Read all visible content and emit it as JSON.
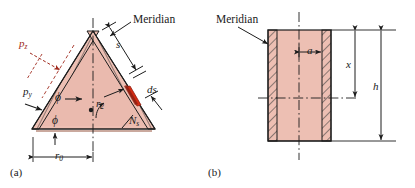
{
  "figure": {
    "title_hidden": "Conical and cylindrical shell membrane stress diagrams",
    "colors": {
      "shell_fill": "#edbfb3",
      "shell_fill_dark": "#e2ab9d",
      "wall_hatch_line": "#3a3a3a",
      "outline": "#1c1c1c",
      "element_red": "#d52b12",
      "element_red_dark": "#8f2012",
      "pz_red": "#a02a1e",
      "axis_line": "#1c1c1c",
      "background": "#ffffff"
    },
    "panel_a": {
      "caption": "(a)",
      "labels": {
        "meridian": "Meridian",
        "s": "s",
        "ds": "ds",
        "pz": "p",
        "pz_sub": "z",
        "py": "p",
        "py_sub": "y",
        "phi_upper": "ϕ",
        "phi_lower": "ϕ",
        "r2": "r",
        "r2_sub": "2",
        "Ns": "N",
        "Ns_sub": "s",
        "r0": "r",
        "r0_sub": "0"
      }
    },
    "panel_b": {
      "caption": "(b)",
      "labels": {
        "meridian": "Meridian",
        "a": "a",
        "x": "x",
        "h": "h"
      }
    }
  }
}
